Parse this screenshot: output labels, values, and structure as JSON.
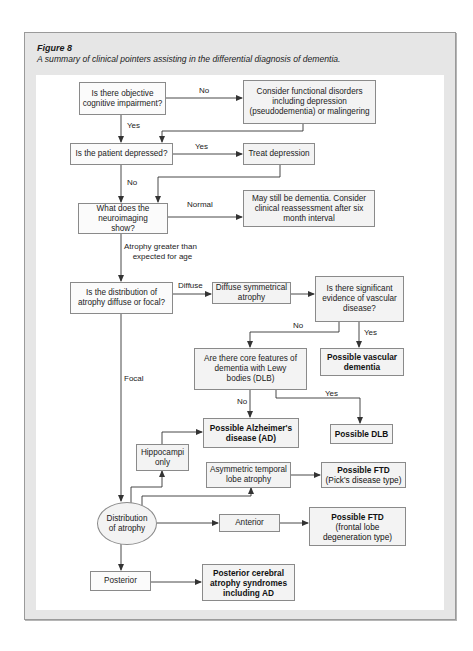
{
  "figure": {
    "label": "Figure 8",
    "caption": "A summary of clinical pointers assisting in the differential diagnosis of dementia."
  },
  "nodes": {
    "objective_impairment": "Is there objective cognitive impairment?",
    "functional_disorders": "Consider functional disorders including depression (pseudodementia) or malingering",
    "patient_depressed": "Is the patient depressed?",
    "treat_depression": "Treat depression",
    "neuroimaging": "What does the neuroimaging show?",
    "may_still_be_dementia": "May still be dementia. Consider clinical reassessment after six month interval",
    "distribution_question": "Is the distribution of atrophy diffuse or focal?",
    "diffuse_symmetrical": "Diffuse symmetrical atrophy",
    "vascular_question": "Is there significant evidence of vascular disease?",
    "dlb_question": "Are there core features of dementia with Lewy bodies (DLB)",
    "possible_vascular": "Possible vascular dementia",
    "possible_ad": "Possible Alzheimer's disease (AD)",
    "possible_dlb": "Possible DLB",
    "hippocampi_only": "Hippocampi only",
    "asymmetric_temporal": "Asymmetric temporal lobe atrophy",
    "ftd_picks_title": "Possible FTD",
    "ftd_picks_sub": "(Pick's disease type)",
    "distribution_of_atrophy": "Distribution of atrophy",
    "anterior": "Anterior",
    "ftd_frontal_title": "Possible FTD",
    "ftd_frontal_sub": "(frontal lobe degeneration type)",
    "posterior": "Posterior",
    "posterior_syndromes": "Posterior cerebral atrophy syndromes including AD"
  },
  "edge_labels": {
    "no_1": "No",
    "yes_1": "Yes",
    "yes_2": "Yes",
    "no_2": "No",
    "normal": "Normal",
    "atrophy_line1": "Atrophy greater than",
    "atrophy_line2": "expected for age",
    "diffuse": "Diffuse",
    "no_3": "No",
    "yes_3": "Yes",
    "focal": "Focal",
    "no_4": "No",
    "yes_4": "Yes"
  },
  "colors": {
    "frame_bg": "#e6e6e6",
    "box_fill": "#f3f3f3",
    "box_border": "#8a8a8a",
    "line": "#333333"
  }
}
